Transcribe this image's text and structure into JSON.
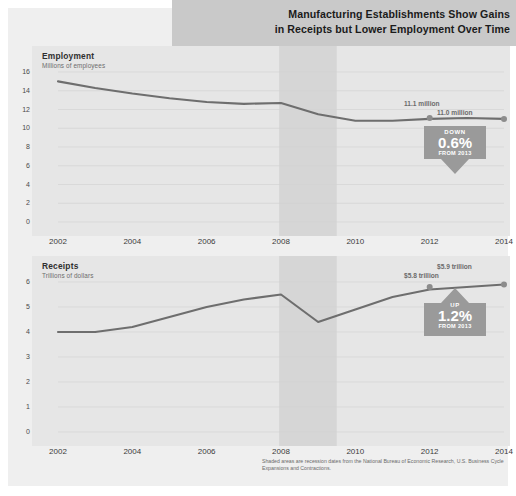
{
  "title": {
    "line1": "Manufacturing Establishments Show Gains",
    "line2": "in Receipts but Lower Employment Over Time"
  },
  "colors": {
    "page_background": "#efefef",
    "panel_background": "#e6e6e6",
    "title_band": "#c9c9c9",
    "line": "#6e6e6e",
    "recession_shade": "#d6d6d6",
    "badge_down": "#9a9a9a",
    "badge_up": "#9a9a9a",
    "grid": "#d2d2d2"
  },
  "footnote": "Shaded areas are recession dates from the National Bureau of Economic Research, U.S. Business Cycle Expansions and Contractions.",
  "charts": [
    {
      "id": "employment",
      "title": "Employment",
      "subtitle": "Millions of employees",
      "callouts": [
        {
          "label": "11.1 million",
          "x": 2012,
          "y": 11.1
        },
        {
          "label": "11.0 million",
          "x": 2014,
          "y": 11.0
        }
      ],
      "badge": {
        "direction": "DOWN",
        "value": "0.6%",
        "from": "FROM 2013"
      }
    },
    {
      "id": "receipts",
      "title": "Receipts",
      "subtitle": "Trillions of dollars",
      "callouts": [
        {
          "label": "$5.8 trillion",
          "x": 2012,
          "y": 5.8
        },
        {
          "label": "$5.9 trillion",
          "x": 2014,
          "y": 5.9
        }
      ],
      "badge": {
        "direction": "UP",
        "value": "1.2%",
        "from": "FROM 2013"
      }
    }
  ],
  "chart_data": [
    {
      "type": "line",
      "title": "Employment",
      "subtitle": "Millions of employees",
      "xlabel": "",
      "ylabel": "Millions of employees",
      "xlim": [
        2002,
        2014
      ],
      "ylim": [
        0,
        16
      ],
      "yticks": [
        0,
        2,
        4,
        6,
        8,
        10,
        12,
        14,
        16
      ],
      "xticks": [
        2002,
        2004,
        2006,
        2008,
        2010,
        2012,
        2014
      ],
      "grid": true,
      "legend": "none",
      "x": [
        2002,
        2003,
        2004,
        2005,
        2006,
        2007,
        2008,
        2009,
        2010,
        2011,
        2012,
        2013,
        2014
      ],
      "values": [
        15.0,
        14.3,
        13.7,
        13.2,
        12.8,
        12.6,
        12.7,
        11.5,
        10.8,
        10.8,
        11.0,
        11.1,
        11.0
      ],
      "shaded_regions": [
        {
          "start": 2007.95,
          "end": 2009.5,
          "note": "recession"
        }
      ],
      "annotations": [
        {
          "text": "11.1 million",
          "x": 2012.6,
          "y": 11.1
        },
        {
          "text": "11.0 million",
          "x": 2014,
          "y": 11.0
        },
        {
          "text": "DOWN 0.6% FROM 2013",
          "x": 2014,
          "y": 8.5
        }
      ]
    },
    {
      "type": "line",
      "title": "Receipts",
      "subtitle": "Trillions of dollars",
      "xlabel": "",
      "ylabel": "Trillions of dollars",
      "xlim": [
        2002,
        2014
      ],
      "ylim": [
        0,
        6
      ],
      "yticks": [
        0,
        1,
        2,
        3,
        4,
        5,
        6
      ],
      "xticks": [
        2002,
        2004,
        2006,
        2008,
        2010,
        2012,
        2014
      ],
      "grid": true,
      "legend": "none",
      "x": [
        2002,
        2003,
        2004,
        2005,
        2006,
        2007,
        2008,
        2009,
        2010,
        2011,
        2012,
        2013,
        2014
      ],
      "values": [
        4.0,
        4.0,
        4.2,
        4.6,
        5.0,
        5.3,
        5.5,
        4.4,
        4.9,
        5.4,
        5.7,
        5.8,
        5.9
      ],
      "shaded_regions": [
        {
          "start": 2007.95,
          "end": 2009.5,
          "note": "recession"
        }
      ],
      "annotations": [
        {
          "text": "$5.8 trillion",
          "x": 2012.6,
          "y": 5.8
        },
        {
          "text": "$5.9 trillion",
          "x": 2014,
          "y": 5.9
        },
        {
          "text": "UP 1.2% FROM 2013",
          "x": 2014,
          "y": 4.6
        }
      ]
    }
  ],
  "axis": {
    "employment_yticks": [
      "16",
      "14",
      "12",
      "10",
      "8",
      "6",
      "4",
      "2",
      "0"
    ],
    "receipts_yticks": [
      "6",
      "5",
      "4",
      "3",
      "2",
      "1",
      "0"
    ],
    "xticks": [
      "2002",
      "2004",
      "2006",
      "2008",
      "2010",
      "2012",
      "2014"
    ]
  }
}
